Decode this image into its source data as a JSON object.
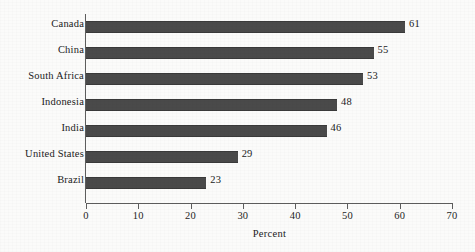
{
  "chart_data": {
    "type": "bar",
    "orientation": "horizontal",
    "title": "",
    "subtitle": "",
    "categories": [
      "Canada",
      "China",
      "South Africa",
      "Indonesia",
      "India",
      "United States",
      "Brazil"
    ],
    "values": [
      61,
      55,
      53,
      48,
      46,
      29,
      23
    ],
    "value_labels": [
      "61",
      "55",
      "53",
      "48",
      "46",
      "29",
      "23"
    ],
    "xlabel": "Percent",
    "ylabel": "",
    "xlim": [
      0,
      70
    ],
    "xticks": [
      0,
      10,
      20,
      30,
      40,
      50,
      60,
      70
    ],
    "xtick_labels": [
      "0",
      "10",
      "20",
      "30",
      "40",
      "50",
      "60",
      "70"
    ],
    "grid": false,
    "legend": null,
    "bar_color": "#4a4a4a",
    "axis_color": "#5d5d5d",
    "background_color": "#fbfbfa",
    "text_color": "#1a1a1a"
  }
}
